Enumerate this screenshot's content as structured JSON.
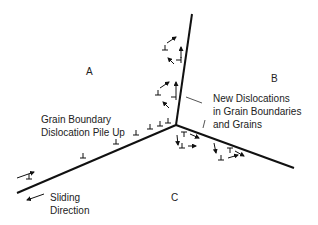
{
  "diagram": {
    "grains": [
      {
        "id": "A",
        "label": "A"
      },
      {
        "id": "B",
        "label": "B"
      },
      {
        "id": "C",
        "label": "C"
      }
    ],
    "annotations": {
      "pile_up_line1": "Grain Boundary",
      "pile_up_line2": "Dislocation Pile Up",
      "new_disl_line1": "New Dislocations",
      "new_disl_line2": "in Grain Boundaries",
      "new_disl_line3": "and Grains",
      "sliding_line1": "Sliding",
      "sliding_line2": "Direction"
    },
    "symbols": {
      "dislocation": "⊥",
      "arrow": "→"
    },
    "colors": {
      "line": "#111111",
      "text": "#222222",
      "background": "#ffffff"
    }
  }
}
